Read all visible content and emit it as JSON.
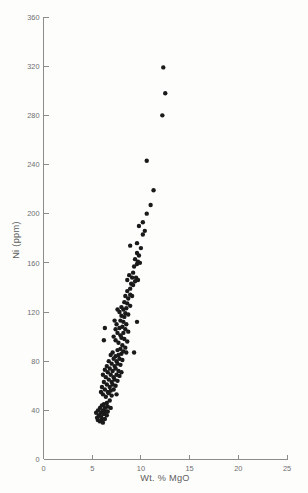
{
  "chart_data": {
    "type": "scatter",
    "title": "",
    "xlabel": "Wt. % MgO",
    "ylabel": "Ni (ppm)",
    "xlim": [
      0,
      25
    ],
    "ylim": [
      0,
      360
    ],
    "xticks": [
      0,
      5,
      10,
      15,
      20,
      25
    ],
    "yticks": [
      0,
      40,
      80,
      120,
      160,
      200,
      240,
      280,
      320,
      360
    ],
    "grid": false,
    "legend": null,
    "marker": "filled-circle",
    "marker_color": "#1a1a1a",
    "marker_size_px": 4.4,
    "n_points": 148,
    "series": [
      {
        "name": "Ni vs MgO",
        "points": [
          [
            12.3,
            319
          ],
          [
            12.5,
            298
          ],
          [
            12.2,
            280
          ],
          [
            10.6,
            243
          ],
          [
            11.3,
            219
          ],
          [
            11.0,
            207
          ],
          [
            10.6,
            200
          ],
          [
            10.2,
            193
          ],
          [
            10.4,
            186
          ],
          [
            10.2,
            183
          ],
          [
            9.8,
            190
          ],
          [
            9.6,
            176
          ],
          [
            8.9,
            174
          ],
          [
            10.0,
            172
          ],
          [
            9.8,
            166
          ],
          [
            9.6,
            168
          ],
          [
            9.7,
            161
          ],
          [
            9.9,
            160
          ],
          [
            9.6,
            159
          ],
          [
            9.4,
            163
          ],
          [
            9.3,
            157
          ],
          [
            9.2,
            152
          ],
          [
            9.5,
            148
          ],
          [
            9.7,
            146
          ],
          [
            9.4,
            145
          ],
          [
            9.1,
            148
          ],
          [
            8.8,
            150
          ],
          [
            8.6,
            146
          ],
          [
            9.0,
            143
          ],
          [
            9.2,
            142
          ],
          [
            8.9,
            139
          ],
          [
            8.6,
            137
          ],
          [
            8.9,
            134
          ],
          [
            9.1,
            133
          ],
          [
            8.7,
            131
          ],
          [
            8.4,
            133
          ],
          [
            8.3,
            128
          ],
          [
            8.6,
            127
          ],
          [
            8.9,
            125
          ],
          [
            8.5,
            123
          ],
          [
            8.2,
            122
          ],
          [
            8.0,
            124
          ],
          [
            8.4,
            119
          ],
          [
            8.7,
            118
          ],
          [
            8.3,
            116
          ],
          [
            8.0,
            117
          ],
          [
            7.8,
            120
          ],
          [
            7.6,
            122
          ],
          [
            7.9,
            113
          ],
          [
            8.2,
            112
          ],
          [
            8.5,
            110
          ],
          [
            9.6,
            112
          ],
          [
            8.1,
            108
          ],
          [
            7.8,
            107
          ],
          [
            7.5,
            110
          ],
          [
            7.3,
            113
          ],
          [
            8.4,
            106
          ],
          [
            8.7,
            104
          ],
          [
            8.2,
            103
          ],
          [
            7.9,
            101
          ],
          [
            7.6,
            103
          ],
          [
            7.4,
            106
          ],
          [
            6.3,
            107
          ],
          [
            8.0,
            99
          ],
          [
            8.3,
            98
          ],
          [
            8.6,
            96
          ],
          [
            6.2,
            97
          ],
          [
            7.7,
            95
          ],
          [
            7.4,
            97
          ],
          [
            7.2,
            100
          ],
          [
            8.1,
            93
          ],
          [
            8.4,
            91
          ],
          [
            7.9,
            90
          ],
          [
            7.6,
            89
          ],
          [
            8.2,
            88
          ],
          [
            8.5,
            87
          ],
          [
            8.0,
            86
          ],
          [
            7.7,
            85
          ],
          [
            9.3,
            87
          ],
          [
            7.4,
            84
          ],
          [
            7.1,
            87
          ],
          [
            7.8,
            82
          ],
          [
            8.1,
            81
          ],
          [
            7.5,
            80
          ],
          [
            7.2,
            82
          ],
          [
            6.9,
            85
          ],
          [
            7.6,
            78
          ],
          [
            7.9,
            77
          ],
          [
            7.3,
            76
          ],
          [
            7.0,
            78
          ],
          [
            6.7,
            80
          ],
          [
            7.4,
            74
          ],
          [
            7.7,
            72
          ],
          [
            8.0,
            71
          ],
          [
            7.1,
            72
          ],
          [
            6.8,
            74
          ],
          [
            6.5,
            76
          ],
          [
            7.5,
            69
          ],
          [
            7.8,
            68
          ],
          [
            7.2,
            67
          ],
          [
            6.9,
            69
          ],
          [
            6.6,
            71
          ],
          [
            6.3,
            73
          ],
          [
            7.3,
            65
          ],
          [
            7.6,
            64
          ],
          [
            7.0,
            63
          ],
          [
            6.7,
            65
          ],
          [
            6.4,
            67
          ],
          [
            6.1,
            69
          ],
          [
            7.1,
            61
          ],
          [
            7.4,
            60
          ],
          [
            6.8,
            59
          ],
          [
            6.5,
            61
          ],
          [
            6.2,
            63
          ],
          [
            7.2,
            57
          ],
          [
            6.9,
            56
          ],
          [
            6.6,
            55
          ],
          [
            6.3,
            57
          ],
          [
            6.0,
            59
          ],
          [
            7.5,
            53
          ],
          [
            7.0,
            52
          ],
          [
            6.7,
            54
          ],
          [
            6.4,
            51
          ],
          [
            6.1,
            53
          ],
          [
            5.9,
            55
          ],
          [
            6.8,
            48
          ],
          [
            6.5,
            46
          ],
          [
            6.2,
            45
          ],
          [
            6.6,
            43
          ],
          [
            6.3,
            42
          ],
          [
            6.9,
            42
          ],
          [
            6.0,
            44
          ],
          [
            5.8,
            42
          ],
          [
            6.1,
            40
          ],
          [
            6.4,
            39
          ],
          [
            5.9,
            38
          ],
          [
            5.6,
            40
          ],
          [
            6.2,
            37
          ],
          [
            5.7,
            36
          ],
          [
            5.4,
            38
          ],
          [
            6.5,
            36
          ],
          [
            5.9,
            35
          ],
          [
            6.0,
            33
          ],
          [
            5.5,
            34
          ],
          [
            6.3,
            33
          ],
          [
            5.8,
            31
          ],
          [
            6.1,
            30
          ],
          [
            5.6,
            32
          ],
          [
            6.6,
            39
          ]
        ]
      }
    ]
  },
  "axes": {
    "y_tick_labels": [
      "0",
      "40",
      "80",
      "120",
      "160",
      "200",
      "240",
      "280",
      "320",
      "360"
    ],
    "x_tick_labels": [
      "0",
      "5",
      "10",
      "15",
      "20",
      "25"
    ],
    "x_title": "Wt. % MgO",
    "y_title": "Ni (ppm)"
  },
  "colors": {
    "background": "#fdfdfc",
    "axis": "#8c8c8c",
    "tick_text": "#6e6e6e",
    "title_text": "#5d5d5d",
    "marker": "#1a1a1a"
  }
}
